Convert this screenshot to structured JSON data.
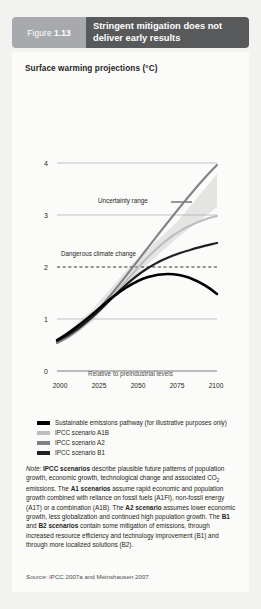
{
  "header": {
    "figure_prefix": "Figure",
    "figure_number": "1.13",
    "title": "Stringent mitigation does not deliver early results"
  },
  "chart_title": "Surface warming projections (°C)",
  "annotations": {
    "uncertainty_range": "Uncertainty range",
    "dangerous_climate_change": "Dangerous climate change"
  },
  "axis_caption": "Relative to preindustrial levels",
  "legend": {
    "items": [
      {
        "label": "Sustainable emissions pathway (for illustrative purposes only)",
        "color": "#000000"
      },
      {
        "label": "IPCC scenario A1B",
        "color": "#bcbec0"
      },
      {
        "label": "IPCC scenario A2",
        "color": "#808285"
      },
      {
        "label": "IPCC scenario B1",
        "color": "#231f20"
      }
    ]
  },
  "note": {
    "label": "Note:",
    "text_parts": [
      {
        "t": "IPCC scenarios",
        "b": true
      },
      {
        "t": " describe plausible future patterns of population growth, economic growth, technological change and associated CO",
        "b": false
      },
      {
        "t": "2",
        "sub": true
      },
      {
        "t": " emissions. The ",
        "b": false
      },
      {
        "t": "A1 scenarios",
        "b": true
      },
      {
        "t": " assume rapid economic and population growth combined with reliance on fossil fuels (A1FI), non-fossil energy (A1T) or a  combination (A1B). The ",
        "b": false
      },
      {
        "t": "A2 scenario",
        "b": true
      },
      {
        "t": " assumes lower economic growth, less globalization and continued high population growth. The ",
        "b": false
      },
      {
        "t": "B1",
        "b": true
      },
      {
        "t": " and ",
        "b": false
      },
      {
        "t": "B2 scenarios",
        "b": true
      },
      {
        "t": " contain some mitigation of emissions, through increased resource efficiency and technology improvement (B1) and through more localized solutions (B2).",
        "b": false
      }
    ]
  },
  "source": {
    "label": "Source:",
    "text": " IPCC 2007a and Meinshausen 2007."
  },
  "colors": {
    "header_num_bg": "#a7a9ac",
    "header_title_bg": "#58595b",
    "page_bg": "#f2f2f0",
    "card_bg": "#fbfbfa",
    "gridline": "#a7a9ac",
    "uncertainty_fill": "#e2e2e0",
    "series_sustainable": "#000000",
    "series_a1b": "#bcbec0",
    "series_a2": "#808285",
    "series_b1": "#231f20"
  },
  "chart_data": {
    "type": "line",
    "title": "Surface warming projections (°C)",
    "xlabel": "Relative to preindustrial levels",
    "ylabel": "°C",
    "xlim": [
      1995,
      2105
    ],
    "ylim": [
      0,
      4.6
    ],
    "grid": true,
    "legend_position": "below",
    "xticks": [
      2000,
      2025,
      2050,
      2075,
      2100
    ],
    "yticks": [
      0,
      1,
      2,
      3,
      4
    ],
    "x": [
      2000,
      2010,
      2020,
      2030,
      2040,
      2050,
      2060,
      2070,
      2080,
      2090,
      2100
    ],
    "series": [
      {
        "name": "Sustainable emissions pathway (for illustrative purposes only)",
        "color": "#000000",
        "values": [
          0.8,
          1.0,
          1.25,
          1.5,
          1.7,
          1.85,
          1.95,
          2.0,
          1.98,
          1.85,
          1.65
        ]
      },
      {
        "name": "IPCC scenario A1B",
        "color": "#bcbec0",
        "values": [
          0.75,
          0.95,
          1.2,
          1.5,
          1.85,
          2.2,
          2.5,
          2.75,
          2.95,
          3.1,
          3.2
        ]
      },
      {
        "name": "IPCC scenario A2",
        "color": "#808285",
        "values": [
          0.75,
          0.95,
          1.2,
          1.55,
          1.95,
          2.35,
          2.75,
          3.15,
          3.55,
          3.9,
          4.25
        ]
      },
      {
        "name": "IPCC scenario B1",
        "color": "#231f20",
        "values": [
          0.8,
          1.0,
          1.25,
          1.48,
          1.68,
          1.85,
          1.98,
          2.08,
          2.15,
          2.22,
          2.3
        ]
      }
    ],
    "bands": [
      {
        "name": "Uncertainty range",
        "fill": "#e2e2e0",
        "x": [
          2000,
          2025,
          2050,
          2075,
          2100
        ],
        "lower": [
          0.75,
          1.2,
          1.8,
          2.3,
          2.7
        ],
        "upper": [
          0.8,
          1.5,
          2.6,
          3.6,
          4.6
        ]
      }
    ],
    "threshold_lines": [
      {
        "name": "Dangerous climate change",
        "y": 2,
        "style": "dashed",
        "color": "#231f20"
      }
    ]
  }
}
